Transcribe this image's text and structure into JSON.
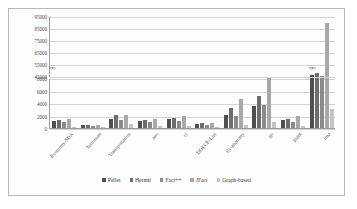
{
  "chart_data": {
    "type": "bar",
    "title": "",
    "xlabel": "",
    "ylabel": "",
    "grid": true,
    "legend_position": "bottom",
    "broken_axis": true,
    "axis_break_marker": "zigzag",
    "lower_axis": {
      "ticks": [
        0,
        2000,
        4000,
        6000,
        8000
      ],
      "ylim": [
        0,
        8000
      ]
    },
    "upper_axis": {
      "ticks": [
        45000,
        55000,
        65000,
        75000,
        85000,
        95000
      ],
      "ylim": [
        45000,
        95000
      ]
    },
    "categories": [
      "Economy-SDA",
      "Terrorism",
      "Transportation",
      "aeo",
      "cl",
      "DOLCE-Lite",
      "fly-anatomy",
      "go",
      "plant",
      "ima"
    ],
    "series": [
      {
        "name": "Pellet",
        "color": "#4f4f4f",
        "values": [
          1150,
          420,
          1500,
          1200,
          1500,
          700,
          2050,
          3450,
          1250,
          47000
        ]
      },
      {
        "name": "Hermit",
        "color": "#6d6d6d",
        "values": [
          1300,
          430,
          2050,
          1350,
          1650,
          780,
          3250,
          5100,
          1400,
          48500
        ]
      },
      {
        "name": "Fact++",
        "color": "#8a8a8a",
        "values": [
          900,
          330,
          1300,
          1000,
          1100,
          520,
          1950,
          3650,
          900,
          45500
        ]
      },
      {
        "name": "JFact",
        "color": "#a8a8a8",
        "values": [
          1500,
          420,
          2150,
          1450,
          1900,
          800,
          4650,
          9200,
          1950,
          90000
        ]
      },
      {
        "name": "Graph-based",
        "color": "#c4c4c4",
        "values": [
          220,
          120,
          620,
          280,
          320,
          180,
          520,
          950,
          260,
          3000
        ]
      }
    ]
  },
  "legend": {
    "items": [
      {
        "label": "Pellet"
      },
      {
        "label": "Hermit"
      },
      {
        "label": "Fact++"
      },
      {
        "label": "JFact"
      },
      {
        "label": "Graph-based"
      }
    ]
  },
  "axis_break_glyph": "≈"
}
